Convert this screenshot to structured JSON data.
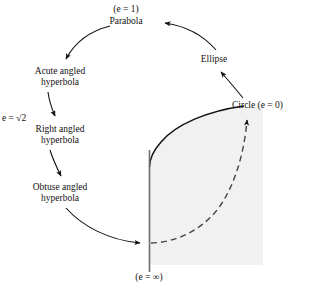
{
  "figure": {
    "background_color": "#ffffff",
    "ink_color": "#111111",
    "shade_color": "#f0f0f0"
  },
  "labels": {
    "e_equals_1": "(e = 1)",
    "parabola": "Parabola",
    "ellipse": "Ellipse",
    "circle": "Circle (e = 0)",
    "acute_hyperbola_line1": "Acute angled",
    "acute_hyperbola_line2": "hyperbola",
    "e_sqrt_2": "e = √2",
    "right_hyperbola_line1": "Right angled",
    "right_hyperbola_line2": "hyperbola",
    "obtuse_hyperbola_line1": "Obtuse angled",
    "obtuse_hyperbola_line2": "hyperbola",
    "e_equals_infinity": "(e = ∞)"
  },
  "nodes": [
    {
      "id": "parabola",
      "label": "Parabola",
      "eccentricity": "1",
      "x": 126,
      "y": 22
    },
    {
      "id": "ellipse",
      "label": "Ellipse",
      "eccentricity": "0 < e < 1",
      "x": 214,
      "y": 60
    },
    {
      "id": "circle",
      "label": "Circle (e = 0)",
      "eccentricity": "0",
      "x": 268,
      "y": 106
    },
    {
      "id": "acute-hyperbola",
      "label": "Acute angled hyperbola",
      "eccentricity": "1 < e < √2",
      "x": 60,
      "y": 76
    },
    {
      "id": "right-hyperbola",
      "label": "Right angled hyperbola",
      "eccentricity": "√2",
      "x": 60,
      "y": 134
    },
    {
      "id": "obtuse-hyperbola",
      "label": "Obtuse angled hyperbola",
      "eccentricity": "e > √2",
      "x": 60,
      "y": 192
    },
    {
      "id": "degenerate",
      "label": "(e = ∞)",
      "eccentricity": "∞",
      "x": 149,
      "y": 276
    }
  ],
  "edges": [
    {
      "from": "ellipse",
      "to": "parabola",
      "style": "solid-arc",
      "direction": "left"
    },
    {
      "from": "circle",
      "to": "ellipse",
      "style": "solid-arc",
      "direction": "up-left"
    },
    {
      "from": "parabola",
      "to": "acute-hyperbola",
      "style": "solid-arc",
      "direction": "down-left"
    },
    {
      "from": "acute-hyperbola",
      "to": "right-hyperbola",
      "style": "solid-arc",
      "direction": "down"
    },
    {
      "from": "right-hyperbola",
      "to": "obtuse-hyperbola",
      "style": "solid-arc",
      "direction": "down"
    },
    {
      "from": "obtuse-hyperbola",
      "to": "degenerate",
      "style": "solid-arc",
      "direction": "down-right"
    },
    {
      "from": "degenerate",
      "to": "circle",
      "style": "dashed-arc",
      "direction": "up-right"
    }
  ],
  "shapes": {
    "solid_curve_description": "solid conic boundary from circle point curving left and down to the vertical axis",
    "vertical_axis_description": "vertical solid line at the degenerate limit",
    "dashed_curve_description": "dashed curve from the degenerate point sweeping right and up to the circle point",
    "shaded_region_description": "light grey filled region bounded by the solid curve, the vertical axis and the right edge"
  }
}
